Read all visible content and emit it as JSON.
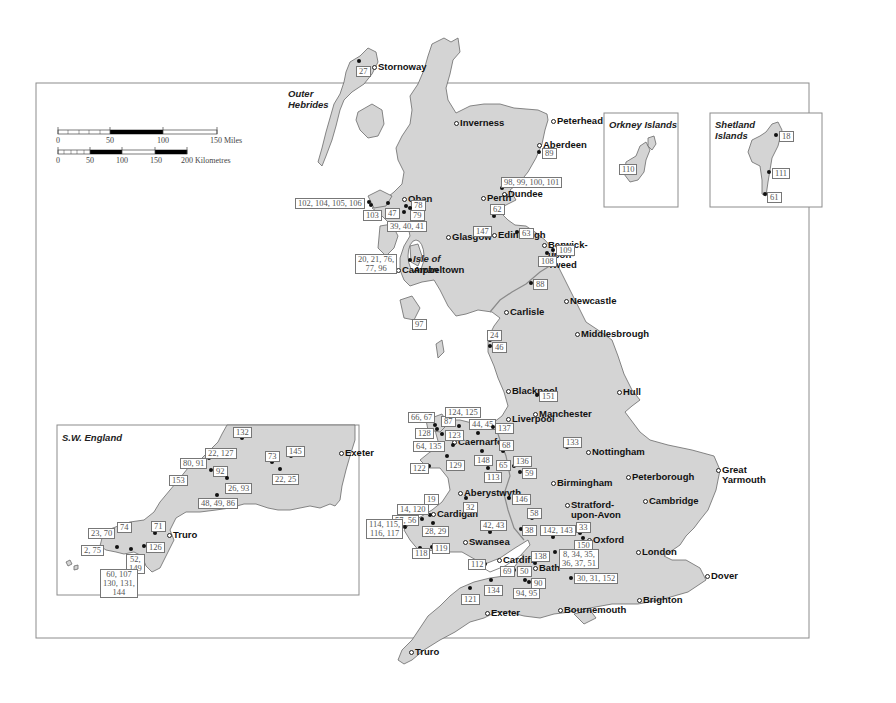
{
  "scale_bar": {
    "miles": {
      "ticks": [
        "0",
        "50",
        "100",
        "150 Miles"
      ]
    },
    "km": {
      "ticks": [
        "0",
        "50",
        "100",
        "150",
        "200 Kilometres"
      ]
    }
  },
  "regions": {
    "outer_hebrides": "Outer\nHebrides",
    "isle_of_arran": "Isle of\nArran",
    "orkney": "Orkney Islands",
    "shetland": "Shetland\nIslands",
    "sw_england": "S.W. England"
  },
  "cities": [
    {
      "name": "Stornoway",
      "x": 374,
      "y": 67
    },
    {
      "name": "Inverness",
      "x": 456,
      "y": 123
    },
    {
      "name": "Peterhead",
      "x": 553,
      "y": 121
    },
    {
      "name": "Aberdeen",
      "x": 539,
      "y": 145
    },
    {
      "name": "Dundee",
      "x": 504,
      "y": 194
    },
    {
      "name": "Perth",
      "x": 483,
      "y": 198
    },
    {
      "name": "Oban",
      "x": 404,
      "y": 199
    },
    {
      "name": "Glasgow",
      "x": 448,
      "y": 237
    },
    {
      "name": "Edinburgh",
      "x": 494,
      "y": 235
    },
    {
      "name": "Berwick-\nupon-\nTweed",
      "x": 544,
      "y": 245
    },
    {
      "name": "Campbeltown",
      "x": 398,
      "y": 270
    },
    {
      "name": "Carlisle",
      "x": 506,
      "y": 312
    },
    {
      "name": "Newcastle",
      "x": 566,
      "y": 301
    },
    {
      "name": "Middlesbrough",
      "x": 577,
      "y": 334
    },
    {
      "name": "Blackpool",
      "x": 508,
      "y": 391
    },
    {
      "name": "Hull",
      "x": 619,
      "y": 392
    },
    {
      "name": "Manchester",
      "x": 535,
      "y": 414
    },
    {
      "name": "Liverpool",
      "x": 508,
      "y": 419
    },
    {
      "name": "Caernarfon",
      "x": 454,
      "y": 442
    },
    {
      "name": "Nottingham",
      "x": 588,
      "y": 452
    },
    {
      "name": "Peterborough",
      "x": 628,
      "y": 477
    },
    {
      "name": "Great\nYarmouth",
      "x": 718,
      "y": 470
    },
    {
      "name": "Birmingham",
      "x": 553,
      "y": 483
    },
    {
      "name": "Cambridge",
      "x": 645,
      "y": 501
    },
    {
      "name": "Stratford-\nupon-Avon",
      "x": 567,
      "y": 505
    },
    {
      "name": "Aberystwyth",
      "x": 460,
      "y": 493
    },
    {
      "name": "Cardigan",
      "x": 433,
      "y": 514
    },
    {
      "name": "Oxford",
      "x": 589,
      "y": 540
    },
    {
      "name": "Swansea",
      "x": 465,
      "y": 542
    },
    {
      "name": "London",
      "x": 638,
      "y": 552
    },
    {
      "name": "Cardiff",
      "x": 499,
      "y": 560
    },
    {
      "name": "Bath",
      "x": 535,
      "y": 568
    },
    {
      "name": "Dover",
      "x": 707,
      "y": 576
    },
    {
      "name": "Bournemouth",
      "x": 560,
      "y": 610
    },
    {
      "name": "Brighton",
      "x": 639,
      "y": 600
    },
    {
      "name": "Exeter",
      "x": 487,
      "y": 613
    },
    {
      "name": "Truro",
      "x": 411,
      "y": 652
    }
  ],
  "sw_cities": [
    {
      "name": "Exeter",
      "x": 341,
      "y": 453
    },
    {
      "name": "Truro",
      "x": 169,
      "y": 535
    }
  ],
  "sites": [
    {
      "label": "27",
      "dx": 359,
      "dy": 61,
      "lx": 356,
      "ly": 66
    },
    {
      "label": "89",
      "dx": 539,
      "dy": 152,
      "lx": 542,
      "ly": 148
    },
    {
      "label": "98, 99, 100, 101",
      "dx": 502,
      "dy": 188,
      "lx": 501,
      "ly": 177
    },
    {
      "label": "62",
      "dx": 494,
      "dy": 216,
      "lx": 490,
      "ly": 204
    },
    {
      "label": "147",
      "dx": 489,
      "dy": 230,
      "lx": 473,
      "ly": 226
    },
    {
      "label": "63",
      "dx": 517,
      "dy": 232,
      "lx": 519,
      "ly": 228
    },
    {
      "label": "102, 104, 105, 106",
      "dx": 369,
      "dy": 202,
      "lx": 295,
      "ly": 198
    },
    {
      "label": "103",
      "dx": 371,
      "dy": 205,
      "lx": 363,
      "ly": 210
    },
    {
      "label": "47",
      "dx": 388,
      "dy": 203,
      "lx": 385,
      "ly": 208
    },
    {
      "label": "78",
      "dx": 406,
      "dy": 206,
      "lx": 411,
      "ly": 200
    },
    {
      "label": "79",
      "dx": 410,
      "dy": 208,
      "lx": 410,
      "ly": 210
    },
    {
      "label": "39, 40, 41",
      "dx": 404,
      "dy": 212,
      "lx": 387,
      "ly": 221
    },
    {
      "label": "20, 21, 76,\n77, 96",
      "dx": 410,
      "dy": 260,
      "lx": 355,
      "ly": 254
    },
    {
      "label": "109",
      "dx": 553,
      "dy": 250,
      "lx": 556,
      "ly": 245
    },
    {
      "label": "108",
      "dx": 547,
      "dy": 253,
      "lx": 538,
      "ly": 256
    },
    {
      "label": "88",
      "dx": 531,
      "dy": 283,
      "lx": 533,
      "ly": 279
    },
    {
      "label": "97",
      "dx": 425,
      "dy": 323,
      "lx": 412,
      "ly": 319
    },
    {
      "label": "24",
      "dx": 490,
      "dy": 340,
      "lx": 487,
      "ly": 330
    },
    {
      "label": "46",
      "dx": 490,
      "dy": 346,
      "lx": 492,
      "ly": 342
    },
    {
      "label": "151",
      "dx": 537,
      "dy": 395,
      "lx": 539,
      "ly": 391
    },
    {
      "label": "66, 67",
      "dx": 435,
      "dy": 425,
      "lx": 408,
      "ly": 412
    },
    {
      "label": "87",
      "dx": 451,
      "dy": 421,
      "lx": 441,
      "ly": 416
    },
    {
      "label": "124, 125",
      "dx": 459,
      "dy": 426,
      "lx": 445,
      "ly": 407
    },
    {
      "label": "128",
      "dx": 437,
      "dy": 429,
      "lx": 415,
      "ly": 428
    },
    {
      "label": "123",
      "dx": 442,
      "dy": 434,
      "lx": 445,
      "ly": 430
    },
    {
      "label": "44, 45",
      "dx": 478,
      "dy": 433,
      "lx": 469,
      "ly": 419
    },
    {
      "label": "137",
      "dx": 493,
      "dy": 427,
      "lx": 495,
      "ly": 423
    },
    {
      "label": "64, 135",
      "dx": 453,
      "dy": 445,
      "lx": 413,
      "ly": 441
    },
    {
      "label": "68",
      "dx": 503,
      "dy": 451,
      "lx": 499,
      "ly": 440
    },
    {
      "label": "133",
      "dx": 567,
      "dy": 447,
      "lx": 563,
      "ly": 437
    },
    {
      "label": "148",
      "dx": 482,
      "dy": 451,
      "lx": 474,
      "ly": 455
    },
    {
      "label": "129",
      "dx": 447,
      "dy": 456,
      "lx": 446,
      "ly": 460
    },
    {
      "label": "65",
      "dx": 508,
      "dy": 463,
      "lx": 496,
      "ly": 460
    },
    {
      "label": "136",
      "dx": 514,
      "dy": 466,
      "lx": 513,
      "ly": 456
    },
    {
      "label": "122",
      "dx": 429,
      "dy": 466,
      "lx": 410,
      "ly": 463
    },
    {
      "label": "113",
      "dx": 488,
      "dy": 468,
      "lx": 484,
      "ly": 472
    },
    {
      "label": "59",
      "dx": 520,
      "dy": 472,
      "lx": 522,
      "ly": 468
    },
    {
      "label": "146",
      "dx": 509,
      "dy": 498,
      "lx": 512,
      "ly": 494
    },
    {
      "label": "32",
      "dx": 466,
      "dy": 498,
      "lx": 463,
      "ly": 502
    },
    {
      "label": "19",
      "dx": 430,
      "dy": 515,
      "lx": 424,
      "ly": 494
    },
    {
      "label": "14, 120",
      "dx": 422,
      "dy": 519,
      "lx": 397,
      "ly": 504
    },
    {
      "label": "57, 56",
      "dx": 415,
      "dy": 520,
      "lx": 392,
      "ly": 515
    },
    {
      "label": "114, 115,\n116, 117",
      "dx": 405,
      "dy": 527,
      "lx": 366,
      "ly": 519
    },
    {
      "label": "28, 29",
      "dx": 433,
      "dy": 523,
      "lx": 422,
      "ly": 526
    },
    {
      "label": "58",
      "dx": 532,
      "dy": 518,
      "lx": 527,
      "ly": 508
    },
    {
      "label": "42, 43",
      "dx": 490,
      "dy": 532,
      "lx": 480,
      "ly": 520
    },
    {
      "label": "38",
      "dx": 521,
      "dy": 529,
      "lx": 522,
      "ly": 525
    },
    {
      "label": "142, 143",
      "dx": 553,
      "dy": 537,
      "lx": 540,
      "ly": 525
    },
    {
      "label": "33",
      "dx": 580,
      "dy": 533,
      "lx": 576,
      "ly": 522
    },
    {
      "label": "150",
      "dx": 583,
      "dy": 538,
      "lx": 574,
      "ly": 540
    },
    {
      "label": "118",
      "dx": 420,
      "dy": 548,
      "lx": 412,
      "ly": 548
    },
    {
      "label": "119",
      "dx": 432,
      "dy": 547,
      "lx": 432,
      "ly": 543
    },
    {
      "label": "8, 34, 35,\n36, 37, 51",
      "dx": 555,
      "dy": 552,
      "lx": 559,
      "ly": 549
    },
    {
      "label": "112",
      "dx": 485,
      "dy": 564,
      "lx": 468,
      "ly": 559
    },
    {
      "label": "138",
      "dx": 535,
      "dy": 563,
      "lx": 531,
      "ly": 551
    },
    {
      "label": "69",
      "dx": 514,
      "dy": 570,
      "lx": 500,
      "ly": 566
    },
    {
      "label": "50",
      "dx": 521,
      "dy": 575,
      "lx": 517,
      "ly": 566
    },
    {
      "label": "90",
      "dx": 529,
      "dy": 582,
      "lx": 531,
      "ly": 578
    },
    {
      "label": "94, 95",
      "dx": 525,
      "dy": 580,
      "lx": 513,
      "ly": 588
    },
    {
      "label": "30, 31, 152",
      "dx": 571,
      "dy": 578,
      "lx": 574,
      "ly": 573
    },
    {
      "label": "134",
      "dx": 491,
      "dy": 580,
      "lx": 484,
      "ly": 585
    },
    {
      "label": "121",
      "dx": 470,
      "dy": 588,
      "lx": 461,
      "ly": 594
    },
    {
      "label": "110",
      "dx": 634,
      "dy": 169,
      "lx": 619,
      "ly": 164
    },
    {
      "label": "18",
      "dx": 776,
      "dy": 135,
      "lx": 779,
      "ly": 131
    },
    {
      "label": "111",
      "dx": 769,
      "dy": 172,
      "lx": 772,
      "ly": 168
    },
    {
      "label": "61",
      "dx": 765,
      "dy": 194,
      "lx": 767,
      "ly": 192
    }
  ],
  "sw_sites": [
    {
      "label": "132",
      "dx": 242,
      "dy": 438,
      "lx": 233,
      "ly": 427
    },
    {
      "label": "145",
      "dx": 291,
      "dy": 456,
      "lx": 286,
      "ly": 446
    },
    {
      "label": "73",
      "dx": 272,
      "dy": 462,
      "lx": 265,
      "ly": 451
    },
    {
      "label": "22, 127",
      "dx": 209,
      "dy": 458,
      "lx": 205,
      "ly": 448
    },
    {
      "label": "80, 91",
      "dx": 200,
      "dy": 467,
      "lx": 180,
      "ly": 458
    },
    {
      "label": "92",
      "dx": 211,
      "dy": 470,
      "lx": 213,
      "ly": 466
    },
    {
      "label": "22, 25",
      "dx": 280,
      "dy": 469,
      "lx": 272,
      "ly": 474
    },
    {
      "label": "153",
      "dx": 184,
      "dy": 478,
      "lx": 169,
      "ly": 475
    },
    {
      "label": "26, 93",
      "dx": 227,
      "dy": 478,
      "lx": 225,
      "ly": 483
    },
    {
      "label": "48, 49, 86",
      "dx": 217,
      "dy": 495,
      "lx": 198,
      "ly": 498
    },
    {
      "label": "74",
      "dx": 119,
      "dy": 530,
      "lx": 117,
      "ly": 522
    },
    {
      "label": "71",
      "dx": 155,
      "dy": 533,
      "lx": 151,
      "ly": 521
    },
    {
      "label": "23, 70",
      "dx": 109,
      "dy": 537,
      "lx": 88,
      "ly": 528
    },
    {
      "label": "2, 75",
      "dx": 102,
      "dy": 547,
      "lx": 81,
      "ly": 545
    },
    {
      "label": "126",
      "dx": 144,
      "dy": 546,
      "lx": 146,
      "ly": 542
    },
    {
      "label": "52,\n149",
      "dx": 131,
      "dy": 549,
      "lx": 126,
      "ly": 554
    },
    {
      "label": "60, 107\n130, 131,\n144",
      "dx": 117,
      "dy": 547,
      "lx": 100,
      "ly": 569
    }
  ]
}
